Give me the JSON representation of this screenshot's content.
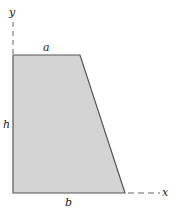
{
  "diagram": {
    "type": "trapezoid-area-figure",
    "labels": {
      "y_axis": "y",
      "x_axis": "x",
      "top_width": "a",
      "height": "h",
      "bottom_width": "b"
    },
    "colors": {
      "fill": "#d4d4d4",
      "stroke": "#555555",
      "axis": "#666666"
    }
  }
}
